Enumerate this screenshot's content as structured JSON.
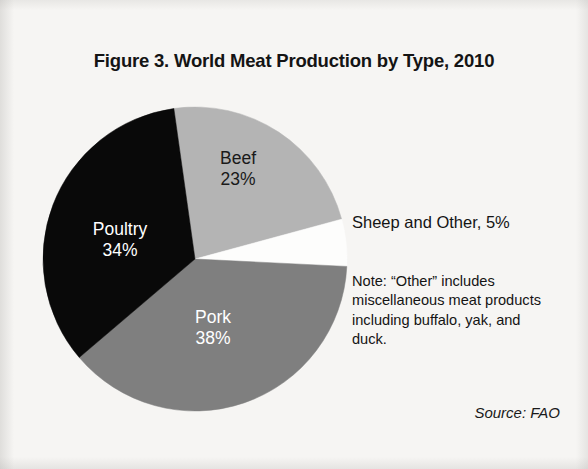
{
  "figure": {
    "title": "Figure 3. World Meat Production by Type, 2010",
    "callout_sheep": "Sheep and Other, 5%",
    "note": "Note: “Other” includes miscellaneous meat products including buffalo, yak, and duck.",
    "source": "Source: FAO",
    "background_color": "#f6f5f3"
  },
  "chart_data": {
    "type": "pie",
    "title": "Figure 3. World Meat Production by Type, 2010",
    "unit": "percent",
    "start_angle_deg": -8,
    "direction": "clockwise",
    "center": {
      "x": 195,
      "y": 259
    },
    "radius": 152,
    "legend": "none",
    "labels_inside": true,
    "categories": [
      "Beef",
      "Sheep and Other",
      "Pork",
      "Poultry"
    ],
    "values": [
      23,
      5,
      38,
      34
    ],
    "slices": [
      {
        "name": "Beef",
        "label": "Beef",
        "value_label": "23%",
        "value": 23,
        "color": "#b4b4b4",
        "text_color": "#1a1a1a",
        "label_x": 238,
        "label_y": 164
      },
      {
        "name": "Sheep and Other",
        "label": "",
        "value_label": "",
        "value": 5,
        "color": "#fdfdfc",
        "text_color": "#1a1a1a",
        "label_x": 0,
        "label_y": 0
      },
      {
        "name": "Pork",
        "label": "Pork",
        "value_label": "38%",
        "value": 38,
        "color": "#7f7f7f",
        "text_color": "#ffffff",
        "label_x": 213,
        "label_y": 323
      },
      {
        "name": "Poultry",
        "label": "Poultry",
        "value_label": "34%",
        "value": 34,
        "color": "#090909",
        "text_color": "#ffffff",
        "label_x": 120,
        "label_y": 235
      }
    ],
    "annotations": [
      {
        "name": "sheep-callout",
        "text": "Sheep and Other, 5%"
      },
      {
        "name": "note",
        "text": "Note: “Other” includes miscellaneous meat products including buffalo, yak, and duck."
      },
      {
        "name": "source",
        "text": "Source: FAO"
      }
    ]
  }
}
